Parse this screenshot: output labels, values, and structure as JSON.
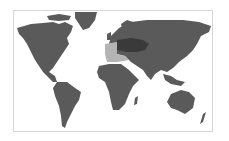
{
  "map": {
    "type": "world-map",
    "projection": "equirectangular",
    "colors": {
      "land": "#5a5a5a",
      "highlight_light": "#b4b4b4",
      "highlight_dark": "#3a3a3a",
      "ocean": "#ffffff",
      "border": "#d6d6d6"
    },
    "highlighted_regions": [
      {
        "name": "Western Mediterranean (Iberia, NW Africa)",
        "shade": "light"
      },
      {
        "name": "Southern Europe / Mediterranean basin",
        "shade": "dark"
      }
    ]
  }
}
